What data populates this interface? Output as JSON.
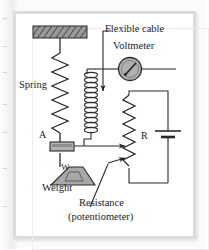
{
  "figure": {
    "kind": "physics-diagram",
    "labels": {
      "flexible_cable": "Flexible cable",
      "voltmeter": "Voltmeter",
      "spring": "Spring",
      "contact_a": "A",
      "resistor_r": "R",
      "weight_block": "W",
      "weight": "Weight",
      "resistance": "Resistance",
      "potentiometer": "(potentiometer)"
    },
    "components": {
      "ceiling_support": "hatched-ceiling-support",
      "spring": "zigzag-spring",
      "coil": "helical-coil",
      "voltmeter": "voltmeter-gauge",
      "contact_block": "sliding-contact-block",
      "weight": "trapezoid-weight",
      "potentiometer": "zigzag-potentiometer",
      "battery": "battery-cell",
      "wiper_upper": "wiper-arrow-upper",
      "wiper_lower": "wiper-arrow-lower"
    },
    "colors": {
      "ink": "#1d1d1d",
      "frame": "#dcdcdc",
      "hatch_fill": "#9a9a9a",
      "block_fill": "#b4b4b4",
      "weight_fill": "#a8a8a8",
      "meter_fill": "#b0b0b0",
      "page": "#ffffff"
    }
  }
}
